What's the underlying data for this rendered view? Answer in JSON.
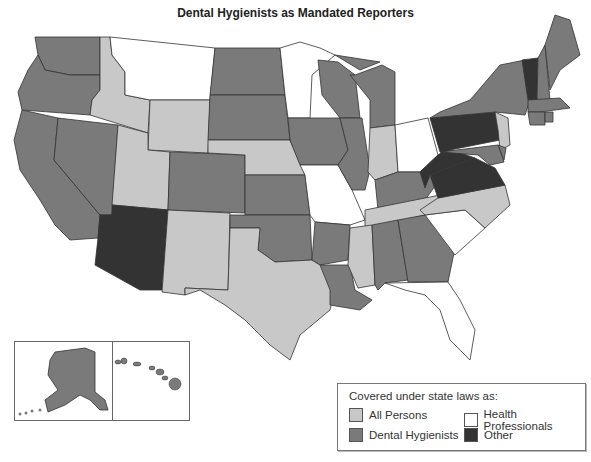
{
  "title": "Dental Hygienists as Mandated Reporters",
  "legend": {
    "title": "Covered under state laws as:",
    "items": [
      {
        "key": "all_persons",
        "label": "All Persons",
        "color": "#c8c8c8"
      },
      {
        "key": "health_professionals",
        "label": "Health Professionals",
        "color": "#ffffff"
      },
      {
        "key": "dental_hygienists",
        "label": "Dental Hygienists",
        "color": "#7a7a7a"
      },
      {
        "key": "other",
        "label": "Other",
        "color": "#333333"
      }
    ]
  },
  "categories": {
    "all_persons": [
      "ID",
      "WY",
      "UT",
      "NE",
      "NM",
      "TX",
      "IN",
      "NC",
      "TN",
      "MS",
      "NJ"
    ],
    "dental_hygienists": [
      "WA",
      "OR",
      "CA",
      "NV",
      "CO",
      "ND",
      "SD",
      "KS",
      "OK",
      "AR",
      "LA",
      "IA",
      "WI",
      "IL",
      "MI",
      "KY",
      "AL",
      "GA",
      "NY",
      "ME",
      "NH",
      "MA",
      "CT",
      "RI",
      "MD",
      "DE",
      "AK",
      "HI"
    ],
    "health_professionals": [
      "MT",
      "MN",
      "MO",
      "OH",
      "SC",
      "FL"
    ],
    "other": [
      "AZ",
      "PA",
      "WV",
      "VA",
      "VT"
    ]
  },
  "insets": [
    "Alaska",
    "Hawaii"
  ]
}
